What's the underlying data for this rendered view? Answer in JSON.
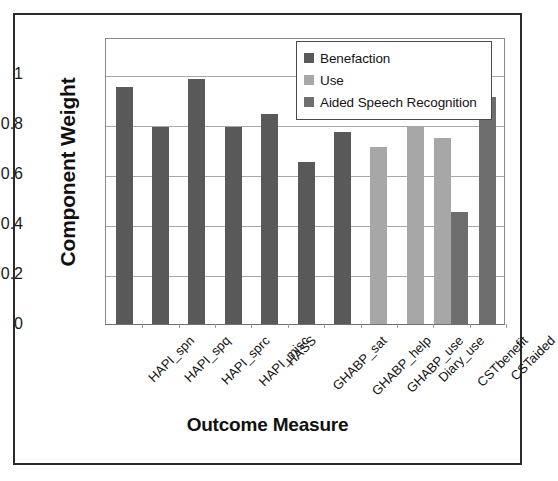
{
  "chart_data": {
    "type": "bar",
    "title": "",
    "xlabel": "Outcome Measure",
    "ylabel": "Component Weight",
    "ylim": [
      0,
      1.15
    ],
    "yticks": [
      0,
      0.2,
      0.4,
      0.6,
      0.8,
      1
    ],
    "ytick_labels": [
      "0",
      "0.2",
      "0.4",
      "0.6",
      "0.8",
      "1"
    ],
    "grid": "horizontal",
    "legend_position": "top-right",
    "categories": [
      "HAPI_spn",
      "HAPI_spq",
      "HAPI_sprc",
      "HAPI_misc",
      "HASS",
      "GHABP_sat",
      "GHABP_help",
      "GHABP_use",
      "Diary_use",
      "CSTbenefit",
      "CSTaided"
    ],
    "series": [
      {
        "name": "Benefaction",
        "color": "#595959",
        "values": [
          0.95,
          0.79,
          0.98,
          0.79,
          0.84,
          0.65,
          0.77,
          null,
          null,
          null,
          null
        ]
      },
      {
        "name": "Use",
        "color": "#a7a7a7",
        "values": [
          null,
          null,
          null,
          null,
          null,
          null,
          null,
          0.71,
          0.795,
          0.745,
          null
        ]
      },
      {
        "name": "Aided Speech Recognition",
        "color": "#6e6e6e",
        "values": [
          null,
          null,
          null,
          null,
          null,
          null,
          null,
          null,
          null,
          0.45,
          0.91
        ]
      }
    ]
  },
  "legend": {
    "items": [
      {
        "label": "Benefaction",
        "color": "#595959"
      },
      {
        "label": "Use",
        "color": "#a7a7a7"
      },
      {
        "label": "Aided Speech Recognition",
        "color": "#6e6e6e"
      }
    ]
  }
}
